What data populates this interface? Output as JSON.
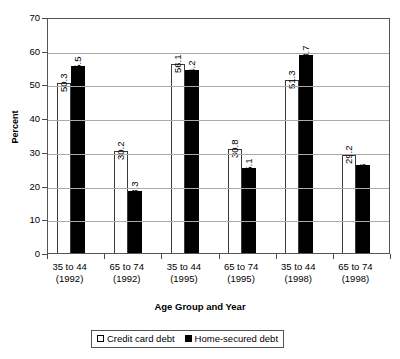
{
  "chart_data": {
    "type": "bar",
    "title": "",
    "xlabel": "Age Group and Year",
    "ylabel": "Percent",
    "ylim": [
      0,
      70
    ],
    "yticks": [
      0,
      10,
      20,
      30,
      40,
      50,
      60,
      70
    ],
    "ytick_labels": [
      "0",
      "10",
      "20",
      "30",
      "40",
      "50",
      "60",
      "70"
    ],
    "grid": true,
    "legend_position": "bottom",
    "categories": [
      "35 to 44\n(1992)",
      "65 to 74\n(1992)",
      "35 to 44\n(1995)",
      "65 to 74\n(1995)",
      "35 to 44\n(1998)",
      "65 to 74\n(1998)"
    ],
    "category_lines": [
      [
        "35 to 44",
        "(1992)"
      ],
      [
        "65 to 74",
        "(1992)"
      ],
      [
        "35 to 44",
        "(1995)"
      ],
      [
        "65 to 74",
        "(1995)"
      ],
      [
        "35 to 44",
        "(1998)"
      ],
      [
        "65 to 74",
        "(1998)"
      ]
    ],
    "series": [
      {
        "name": "Credit card debt",
        "color": "#ffffff",
        "values": [
          50.3,
          30.2,
          56.1,
          30.8,
          51.3,
          29.2
        ],
        "labels": [
          "50.3",
          "30.2",
          "56.1",
          "30.8",
          "51.3",
          "29.2"
        ]
      },
      {
        "name": "Home-secured debt",
        "color": "#000000",
        "values": [
          55.5,
          18.3,
          54.2,
          25.1,
          58.7,
          26
        ],
        "labels": [
          "55.5",
          "18.3",
          "54.2",
          "25.1",
          "58.7",
          "26"
        ]
      }
    ]
  },
  "legend": {
    "items": [
      {
        "label": "Credit card debt",
        "swatch": "light"
      },
      {
        "label": "Home-secured debt",
        "swatch": "dark"
      }
    ]
  },
  "colors": {
    "series_light": "#ffffff",
    "series_dark": "#000000",
    "gridline": "#aaaaaa",
    "frame": "#555555",
    "background": "#ffffff"
  }
}
